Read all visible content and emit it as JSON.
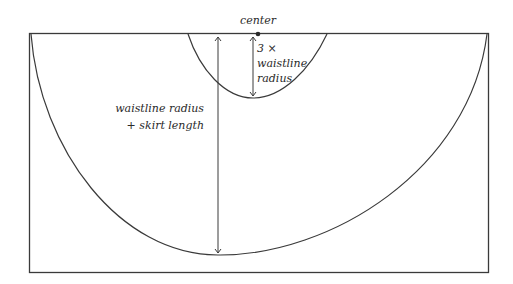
{
  "diagram": {
    "labels": {
      "center": "center",
      "inner_line1": "3 ×",
      "inner_line2": "waistline",
      "inner_line3": "radius",
      "outer_line1": "waistline radius",
      "outer_line2": "+ skirt length"
    },
    "colors": {
      "stroke": "#3a3a3a",
      "background": "#ffffff"
    }
  }
}
